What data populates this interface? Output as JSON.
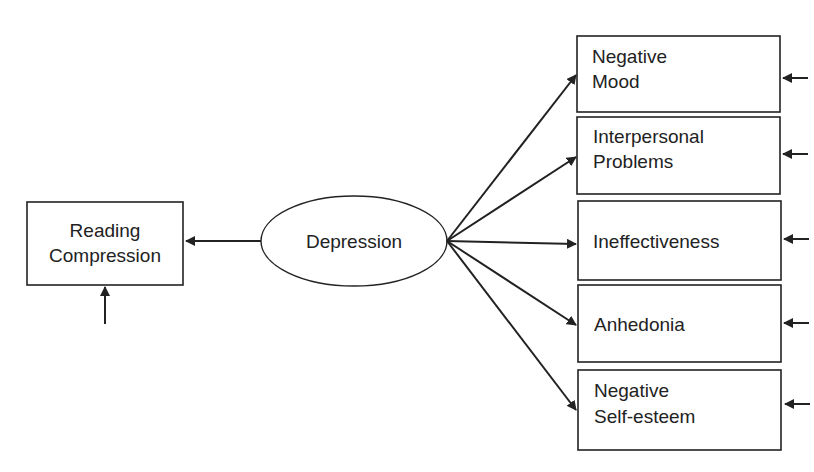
{
  "diagram": {
    "type": "structural-equation-model",
    "latent": {
      "label": "Depression"
    },
    "outcome": {
      "label_lines": [
        "Reading",
        "Compression"
      ]
    },
    "indicators": [
      {
        "label_lines": [
          "Negative",
          "Mood"
        ]
      },
      {
        "label_lines": [
          "Interpersonal",
          "Problems"
        ]
      },
      {
        "label_lines": [
          "Ineffectiveness"
        ]
      },
      {
        "label_lines": [
          "Anhedonia"
        ]
      },
      {
        "label_lines": [
          "Negative",
          "Self-esteem"
        ]
      }
    ],
    "edges": [
      {
        "from": "Depression",
        "to": "Reading Compression"
      },
      {
        "from": "Depression",
        "to": "Negative Mood"
      },
      {
        "from": "Depression",
        "to": "Interpersonal Problems"
      },
      {
        "from": "Depression",
        "to": "Ineffectiveness"
      },
      {
        "from": "Depression",
        "to": "Anhedonia"
      },
      {
        "from": "Depression",
        "to": "Negative Self-esteem"
      },
      {
        "from": "error",
        "to": "Reading Compression"
      },
      {
        "from": "error",
        "to": "Negative Mood"
      },
      {
        "from": "error",
        "to": "Interpersonal Problems"
      },
      {
        "from": "error",
        "to": "Ineffectiveness"
      },
      {
        "from": "error",
        "to": "Anhedonia"
      },
      {
        "from": "error",
        "to": "Negative Self-esteem"
      }
    ],
    "colors": {
      "stroke": "#222222",
      "background": "#ffffff"
    }
  }
}
